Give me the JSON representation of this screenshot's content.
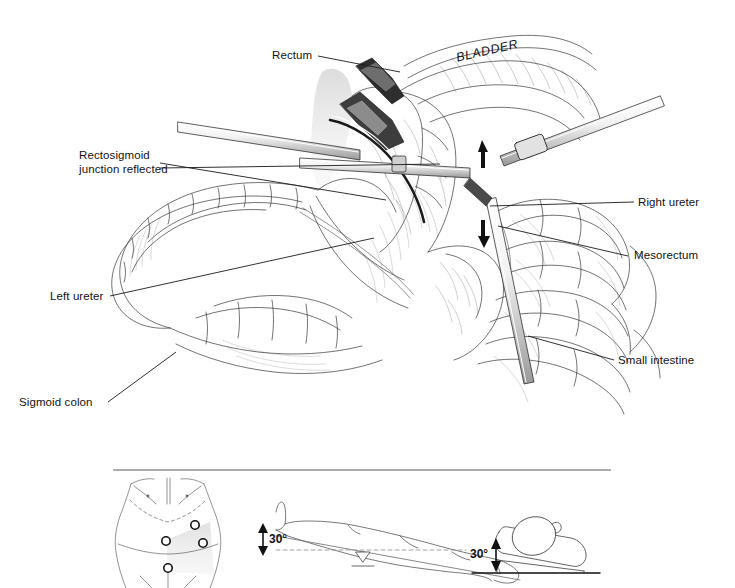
{
  "figure": {
    "type": "medical-surgical-illustration",
    "background_color": "#ffffff",
    "ink_color": "#1a1a1a",
    "shade_color": "#d9d9d9"
  },
  "labels": {
    "rectum": "Rectum",
    "bladder": "BLADDER",
    "rectosigmoid_line1": "Rectosigmoid",
    "rectosigmoid_line2": "junction reflected",
    "left_ureter": "Left ureter",
    "sigmoid_colon": "Sigmoid colon",
    "right_ureter": "Right ureter",
    "mesorectum": "Mesorectum",
    "small_intestine": "Small intestine"
  },
  "insets": {
    "port_placement": {
      "name": "abdominal port placement",
      "port_count": 4
    },
    "trendelenburg": {
      "name": "Trendelenburg position",
      "angle": "30°"
    },
    "table_tilt": {
      "name": "table tilt",
      "angle": "30°"
    }
  },
  "divider": {
    "present": true
  }
}
